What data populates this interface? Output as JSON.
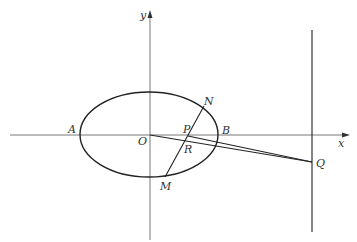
{
  "diagram": {
    "type": "ellipse-coordinate-geometry",
    "axes": {
      "x_label": "x",
      "y_label": "y",
      "origin_label": "O"
    },
    "points": {
      "A": {
        "label": "A",
        "desc": "left vertex of ellipse"
      },
      "B": {
        "label": "B",
        "desc": "right vertex of ellipse"
      },
      "O": {
        "label": "O",
        "desc": "origin"
      },
      "N": {
        "label": "N",
        "desc": "upper intersection of chord with ellipse"
      },
      "M": {
        "label": "M",
        "desc": "lower intersection of chord with ellipse"
      },
      "P": {
        "label": "P",
        "desc": "intersection of chord MN with x-axis"
      },
      "R": {
        "label": "R",
        "desc": "intersection of chord MN with segment OQ"
      },
      "Q": {
        "label": "Q",
        "desc": "point on vertical line right of ellipse"
      }
    },
    "elements": [
      "ellipse centered at O",
      "x-axis",
      "y-axis",
      "vertical line through Q",
      "chord MN",
      "segment OQ",
      "segment PQ"
    ],
    "stroke_color": "#222222"
  }
}
